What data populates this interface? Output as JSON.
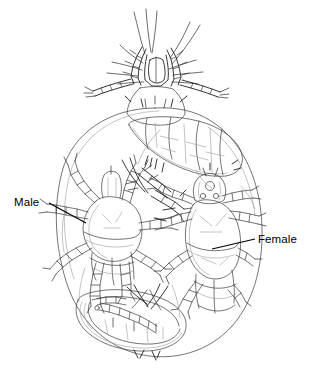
{
  "figure": {
    "type": "scientific-line-drawing",
    "view": "dorsal / in-situ cluster inside host body outline",
    "background_color": "#ffffff",
    "line_color": "#3a3a3a",
    "faint_line_color": "#9a9a9a",
    "label_color": "#000000",
    "width": 312,
    "height": 376
  },
  "callouts": [
    {
      "id": "male",
      "label": "Male",
      "label_x": 14,
      "label_y": 197,
      "leader_from": [
        49,
        203
      ],
      "leader_to": [
        86,
        223
      ]
    },
    {
      "id": "female",
      "label": "Female",
      "label_x": 258,
      "label_y": 234,
      "leader_from": [
        255,
        239
      ],
      "leader_to": [
        212,
        249
      ]
    }
  ],
  "labels": {
    "male": "Male",
    "female": "Female"
  },
  "elements": {
    "outer_outline": "large vertical oval enclosing the mite cluster",
    "top_mite": "gnathosoma with palps, chelicerae and setae projecting above the oval",
    "upper_body": "segmented elongate body angled down-right inside the oval",
    "male_mite": "smaller mite at left with four pairs of segmented legs",
    "female_mite": "larger mite at right with segmented opisthosoma",
    "lower_mite": "elongate mite lying across the lower part of the oval"
  }
}
